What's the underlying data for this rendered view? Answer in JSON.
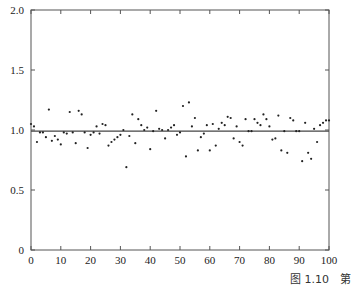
{
  "chart_data": {
    "type": "scatter",
    "title": "",
    "xlabel": "",
    "ylabel": "",
    "xlim": [
      0,
      100
    ],
    "ylim": [
      0,
      2.0
    ],
    "grid": false,
    "x_ticks": [
      0,
      10,
      20,
      30,
      40,
      50,
      60,
      70,
      80,
      90,
      100
    ],
    "y_ticks": [
      0,
      0.5,
      1.0,
      1.5,
      2.0
    ],
    "y_tick_labels": [
      "0",
      "0.5",
      "1.0",
      "1.5",
      "2.0"
    ],
    "reference_line": {
      "y": 0.99,
      "label": "mean"
    },
    "x": [
      0,
      1,
      2,
      3,
      4,
      5,
      6,
      7,
      8,
      9,
      10,
      11,
      12,
      13,
      14,
      15,
      16,
      17,
      18,
      19,
      20,
      21,
      22,
      23,
      24,
      25,
      26,
      27,
      28,
      29,
      30,
      31,
      32,
      33,
      34,
      35,
      36,
      37,
      38,
      39,
      40,
      41,
      42,
      43,
      44,
      45,
      46,
      47,
      48,
      49,
      50,
      51,
      52,
      53,
      54,
      55,
      56,
      57,
      58,
      59,
      60,
      61,
      62,
      63,
      64,
      65,
      66,
      67,
      68,
      69,
      70,
      71,
      72,
      73,
      74,
      75,
      76,
      77,
      78,
      79,
      80,
      81,
      82,
      83,
      84,
      85,
      86,
      87,
      88,
      89,
      90,
      91,
      92,
      93,
      94,
      95,
      96,
      97,
      98,
      99,
      100
    ],
    "y": [
      1.05,
      1.03,
      0.9,
      0.98,
      0.98,
      0.94,
      1.17,
      0.91,
      0.95,
      0.92,
      0.88,
      0.98,
      0.97,
      1.15,
      0.98,
      0.89,
      1.16,
      1.13,
      0.98,
      0.85,
      0.96,
      0.98,
      1.03,
      0.97,
      1.05,
      1.04,
      0.87,
      0.9,
      0.92,
      0.94,
      0.96,
      1.0,
      0.69,
      0.95,
      1.13,
      0.89,
      1.09,
      1.04,
      1.0,
      1.02,
      0.84,
      0.99,
      1.16,
      1.01,
      1.0,
      0.93,
      1.0,
      1.02,
      1.04,
      0.96,
      0.98,
      1.2,
      0.78,
      1.23,
      1.03,
      1.1,
      0.83,
      0.94,
      0.97,
      1.04,
      0.83,
      1.05,
      0.87,
      1.01,
      1.06,
      1.04,
      1.11,
      1.1,
      0.93,
      1.03,
      0.9,
      0.87,
      1.09,
      0.99,
      0.99,
      1.09,
      1.06,
      1.04,
      1.13,
      1.09,
      1.03,
      0.92,
      0.93,
      1.12,
      0.83,
      0.99,
      0.81,
      1.1,
      1.08,
      0.99,
      0.99,
      0.74,
      1.06,
      0.81,
      0.76,
      1.01,
      0.9,
      1.04,
      1.06,
      1.08,
      1.08
    ]
  },
  "caption": {
    "text": "图 1.10　第"
  },
  "colors": {
    "axis": "#555555",
    "points": "#222222",
    "line": "#444444"
  }
}
